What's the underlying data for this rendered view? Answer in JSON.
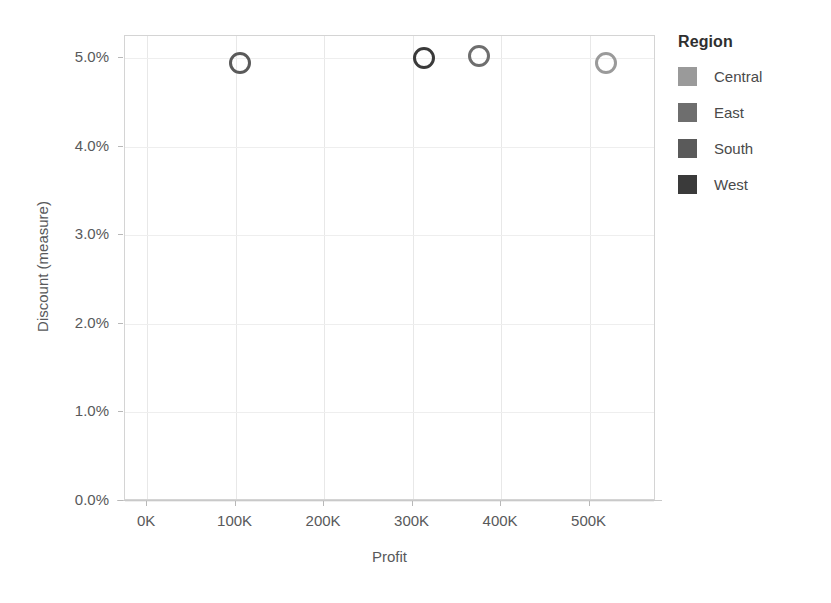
{
  "chart_data": {
    "type": "scatter",
    "title": "",
    "xlabel": "Profit",
    "ylabel": "Discount (measure)",
    "xlim": [
      -25000,
      575000
    ],
    "ylim": [
      0.0,
      0.0525
    ],
    "grid": true,
    "legend_position": "right",
    "x_tick_labels": [
      "0K",
      "100K",
      "200K",
      "300K",
      "400K",
      "500K"
    ],
    "x_tick_values": [
      0,
      100000,
      200000,
      300000,
      400000,
      500000
    ],
    "y_tick_labels": [
      "0.0%",
      "1.0%",
      "2.0%",
      "3.0%",
      "4.0%",
      "5.0%"
    ],
    "y_tick_values": [
      0.0,
      1.0,
      2.0,
      3.0,
      4.0,
      5.0
    ],
    "series": [
      {
        "name": "Central",
        "color": "#9a9a9a",
        "points": [
          {
            "x": 518000,
            "y": 4.95
          }
        ]
      },
      {
        "name": "East",
        "color": "#6e6e6e",
        "points": [
          {
            "x": 375000,
            "y": 5.02
          }
        ]
      },
      {
        "name": "South",
        "color": "#5a5a5a",
        "points": [
          {
            "x": 105000,
            "y": 4.95
          }
        ]
      },
      {
        "name": "West",
        "color": "#3a3a3a",
        "points": [
          {
            "x": 313000,
            "y": 5.0
          }
        ]
      }
    ]
  },
  "legend": {
    "title": "Region",
    "items": [
      {
        "label": "Central",
        "color": "#9a9a9a"
      },
      {
        "label": "East",
        "color": "#6e6e6e"
      },
      {
        "label": "South",
        "color": "#5a5a5a"
      },
      {
        "label": "West",
        "color": "#3a3a3a"
      }
    ]
  },
  "axes": {
    "x_title": "Profit",
    "y_title": "Discount (measure)"
  }
}
